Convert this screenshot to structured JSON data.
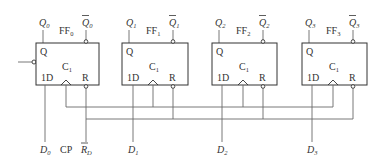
{
  "diagram": {
    "type": "4-bit register of D flip-flops",
    "flip_flops": [
      {
        "name": "FF",
        "index": "0",
        "q": "Q",
        "qbar": "Q",
        "q_sub": "0",
        "pin_q": "Q",
        "pin_c": "C",
        "pin_c_sub": "1",
        "pin_d": "1D",
        "pin_r": "R",
        "d_input": "D",
        "d_sub": "0"
      },
      {
        "name": "FF",
        "index": "1",
        "q": "Q",
        "qbar": "Q",
        "q_sub": "1",
        "pin_q": "Q",
        "pin_c": "C",
        "pin_c_sub": "1",
        "pin_d": "1D",
        "pin_r": "R",
        "d_input": "D",
        "d_sub": "1"
      },
      {
        "name": "FF",
        "index": "2",
        "q": "Q",
        "qbar": "Q",
        "q_sub": "2",
        "pin_q": "Q",
        "pin_c": "C",
        "pin_c_sub": "1",
        "pin_d": "1D",
        "pin_r": "R",
        "d_input": "D",
        "d_sub": "2"
      },
      {
        "name": "FF",
        "index": "3",
        "q": "Q",
        "qbar": "Q",
        "q_sub": "3",
        "pin_q": "Q",
        "pin_c": "C",
        "pin_c_sub": "1",
        "pin_d": "1D",
        "pin_r": "R",
        "d_input": "D",
        "d_sub": "3"
      }
    ],
    "inputs": {
      "clock": "CP",
      "reset": "R",
      "reset_sub": "D"
    },
    "colors": {
      "wire": "#6a6a6a",
      "box": "#333333",
      "text": "#333333"
    }
  }
}
